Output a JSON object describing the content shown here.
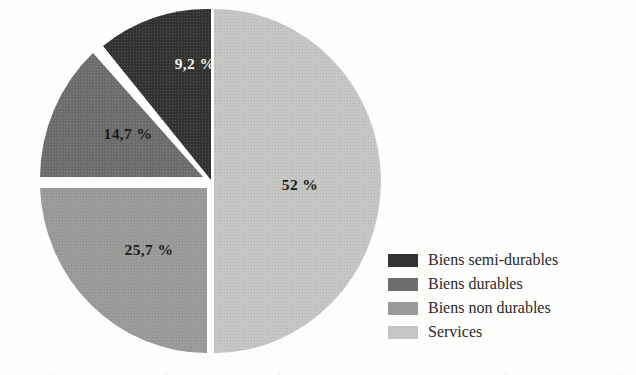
{
  "chart_data": {
    "type": "pie",
    "title": "",
    "subtitle": "",
    "xlabel": "",
    "ylabel": "",
    "grid": false,
    "legend_position": "bottom-right",
    "units": "percent",
    "decimal_separator": ",",
    "categories": [
      "Biens semi-durables",
      "Biens durables",
      "Biens non durables",
      "Services"
    ],
    "values": [
      9.2,
      14.7,
      25.7,
      52
    ],
    "labels": [
      "9,2 %",
      "14,7 %",
      "25,7 %",
      "52 %"
    ],
    "colors": [
      "#333331",
      "#6d6d6b",
      "#9a9a98",
      "#c5c5c3"
    ],
    "slices": [
      {
        "name": "Biens semi-durables",
        "value": 9.2,
        "label": "9,2 %",
        "color": "#333331",
        "label_color": "#f4f4f2",
        "label_x": 195,
        "label_y": 64
      },
      {
        "name": "Biens durables",
        "value": 14.7,
        "label": "14,7 %",
        "color": "#6d6d6b",
        "label_color": "#1b1b1b",
        "label_x": 128,
        "label_y": 134
      },
      {
        "name": "Biens non durables",
        "value": 25.7,
        "label": "25,7 %",
        "color": "#9a9a98",
        "label_color": "#1b1b1b",
        "label_x": 149,
        "label_y": 250
      },
      {
        "name": "Services",
        "value": 52,
        "label": "52 %",
        "color": "#c5c5c3",
        "label_color": "#1b1b1b",
        "label_x": 300,
        "label_y": 185
      }
    ]
  },
  "legend": {
    "items": [
      {
        "label": "Biens semi-durables",
        "color": "#333331"
      },
      {
        "label": "Biens durables",
        "color": "#6d6d6b"
      },
      {
        "label": "Biens non durables",
        "color": "#9a9a98"
      },
      {
        "label": "Services",
        "color": "#c5c5c3"
      }
    ]
  }
}
